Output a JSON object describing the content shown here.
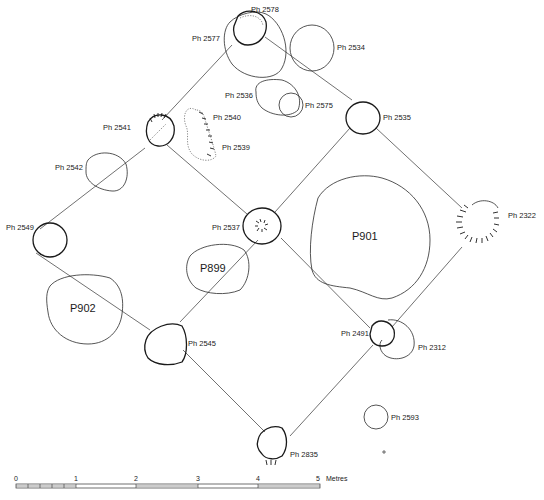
{
  "plan": {
    "postholes": [
      {
        "id": "ph2578",
        "label": "Ph 2578"
      },
      {
        "id": "ph2577",
        "label": "Ph 2577"
      },
      {
        "id": "ph2534",
        "label": "Ph 2534"
      },
      {
        "id": "ph2536",
        "label": "Ph 2536"
      },
      {
        "id": "ph2575",
        "label": "Ph 2575"
      },
      {
        "id": "ph2541",
        "label": "Ph 2541"
      },
      {
        "id": "ph2540",
        "label": "Ph 2540"
      },
      {
        "id": "ph2539",
        "label": "Ph 2539"
      },
      {
        "id": "ph2535",
        "label": "Ph 2535"
      },
      {
        "id": "ph2542",
        "label": "Ph 2542"
      },
      {
        "id": "ph2549",
        "label": "Ph 2549"
      },
      {
        "id": "ph2537",
        "label": "Ph 2537"
      },
      {
        "id": "ph2322",
        "label": "Ph 2322"
      },
      {
        "id": "ph2545",
        "label": "Ph 2545"
      },
      {
        "id": "ph2491",
        "label": "Ph 2491"
      },
      {
        "id": "ph2312",
        "label": "Ph 2312"
      },
      {
        "id": "ph2593",
        "label": "Ph 2593"
      },
      {
        "id": "ph2835",
        "label": "Ph 2835"
      }
    ],
    "pits": [
      {
        "id": "p901",
        "label": "P901"
      },
      {
        "id": "p899",
        "label": "P899"
      },
      {
        "id": "p902",
        "label": "P902"
      }
    ]
  },
  "scale": {
    "ticks": [
      "0",
      "1",
      "2",
      "3",
      "4",
      "5"
    ],
    "unit": "Metres"
  }
}
